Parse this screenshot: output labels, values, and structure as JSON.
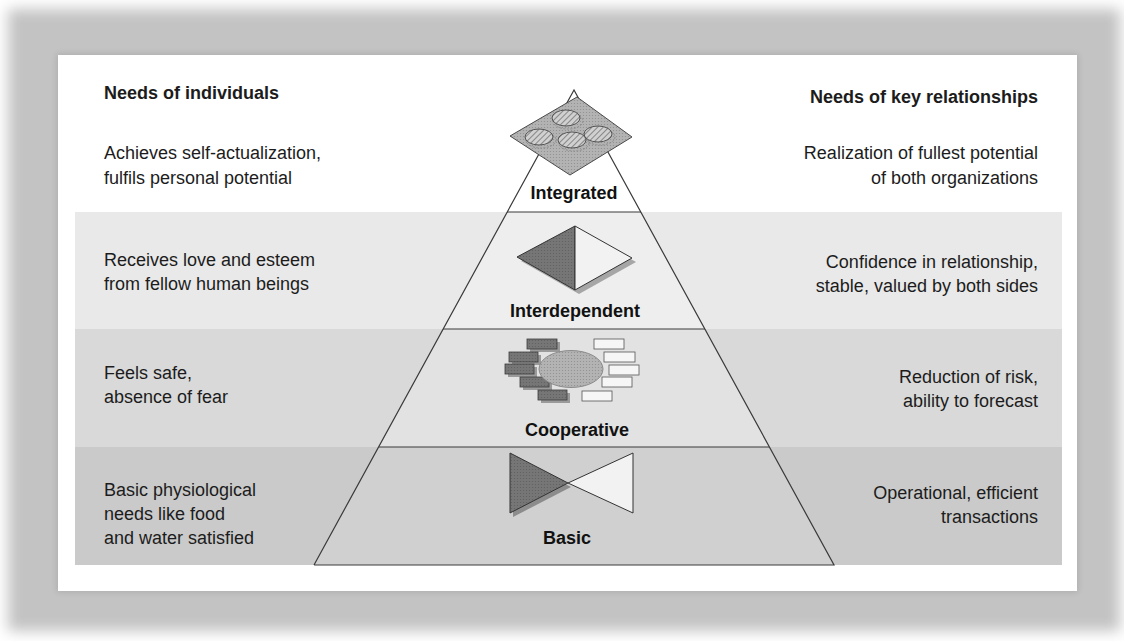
{
  "header": {
    "left_title": "Needs of individuals",
    "right_title": "Needs of key relationships"
  },
  "levels": [
    {
      "name": "Integrated",
      "icon": "diamond-with-clouds-icon",
      "individual": [
        "Achieves self-actualization,",
        "fulfils personal potential"
      ],
      "relationship": [
        "Realization of fullest potential",
        "of both organizations"
      ]
    },
    {
      "name": "Interdependent",
      "icon": "split-diamond-icon",
      "individual": [
        "Receives love and esteem",
        "from fellow human beings"
      ],
      "relationship": [
        "Confidence in relationship,",
        "stable, valued by both sides"
      ]
    },
    {
      "name": "Cooperative",
      "icon": "ellipse-with-bricks-icon",
      "individual": [
        "Feels safe,",
        "absence of fear"
      ],
      "relationship": [
        "Reduction of risk,",
        "ability to forecast"
      ]
    },
    {
      "name": "Basic",
      "icon": "bowtie-icon",
      "individual": [
        "Basic physiological",
        "needs like food",
        "and water satisfied"
      ],
      "relationship": [
        "Operational, efficient",
        "transactions"
      ]
    }
  ],
  "colors": {
    "band_interdependent": "#e9e9e9",
    "band_cooperative": "#d9d9d9",
    "band_basic": "#cacaca",
    "icon_dark": "#767676",
    "icon_light": "#f2f2f2",
    "outline": "#3a3a3a"
  }
}
